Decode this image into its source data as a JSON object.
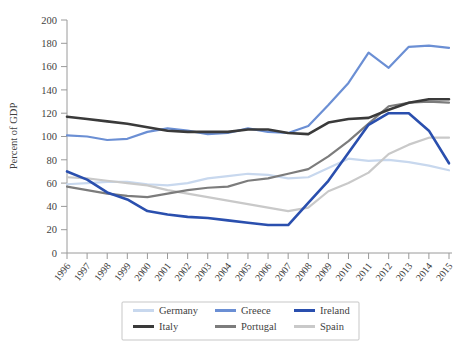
{
  "chart_data": {
    "type": "line",
    "title": "",
    "xlabel": "",
    "ylabel": "Percent of GDP",
    "ylim": [
      0,
      200
    ],
    "yticks": [
      0,
      20,
      40,
      60,
      80,
      100,
      120,
      140,
      160,
      180,
      200
    ],
    "grid": false,
    "legend_position": "bottom",
    "categories": [
      "1996",
      "1997",
      "1998",
      "1999",
      "2000",
      "2001",
      "2002",
      "2003",
      "2004",
      "2005",
      "2006",
      "2007",
      "2008",
      "2009",
      "2010",
      "2011",
      "2012",
      "2013",
      "2014",
      "2015"
    ],
    "series": [
      {
        "name": "Germany",
        "color": "#c8d8ee",
        "values": [
          59,
          60,
          61,
          61,
          59,
          58,
          60,
          64,
          66,
          68,
          67,
          64,
          65,
          73,
          81,
          79,
          80,
          78,
          75,
          71
        ]
      },
      {
        "name": "Greece",
        "color": "#6b8fd4",
        "values": [
          101,
          100,
          97,
          98,
          104,
          107,
          105,
          102,
          103,
          107,
          104,
          103,
          109,
          127,
          146,
          172,
          159,
          177,
          178,
          176
        ]
      },
      {
        "name": "Ireland",
        "color": "#2a4fae",
        "values": [
          70,
          63,
          52,
          46,
          36,
          33,
          31,
          30,
          28,
          26,
          24,
          24,
          43,
          62,
          86,
          110,
          120,
          120,
          105,
          77
        ]
      },
      {
        "name": "Italy",
        "color": "#3a3a3a",
        "values": [
          117,
          115,
          113,
          111,
          108,
          105,
          104,
          104,
          104,
          106,
          106,
          103,
          102,
          112,
          115,
          116,
          123,
          129,
          132,
          132
        ]
      },
      {
        "name": "Portugal",
        "color": "#7c7c7c",
        "values": [
          57,
          54,
          51,
          49,
          48,
          51,
          54,
          56,
          57,
          62,
          64,
          68,
          72,
          83,
          96,
          111,
          126,
          129,
          130,
          129
        ]
      },
      {
        "name": "Spain",
        "color": "#c9c9c9",
        "values": [
          65,
          64,
          62,
          60,
          58,
          54,
          51,
          48,
          45,
          42,
          39,
          36,
          39,
          53,
          60,
          69,
          85,
          93,
          99,
          99
        ]
      }
    ]
  },
  "legend": {
    "entries": [
      {
        "label": "Germany",
        "color": "#c8d8ee"
      },
      {
        "label": "Greece",
        "color": "#6b8fd4"
      },
      {
        "label": "Ireland",
        "color": "#2a4fae"
      },
      {
        "label": "Italy",
        "color": "#3a3a3a"
      },
      {
        "label": "Portugal",
        "color": "#7c7c7c"
      },
      {
        "label": "Spain",
        "color": "#c9c9c9"
      }
    ]
  }
}
